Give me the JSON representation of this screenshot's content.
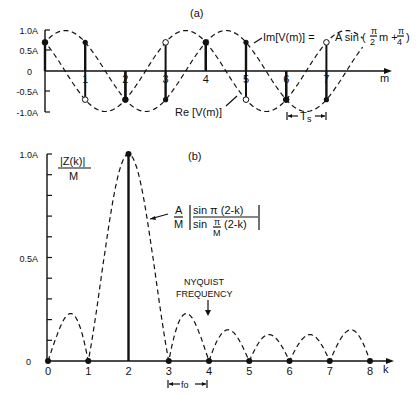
{
  "panel_a": {
    "label": "(a)",
    "y_ticks": [
      "1.0A",
      "0.5A",
      "0",
      "-0.5A",
      "-1.0A"
    ],
    "x_ticks": [
      "1",
      "2",
      "3",
      "4",
      "5",
      "6",
      "7"
    ],
    "x_axis_label": "m",
    "im_label_lhs": "Im[V(m)] = ",
    "im_label_rhs_prefix": "A sin (",
    "im_label_pi": "π",
    "im_label_den2": "2",
    "im_label_m": "m +",
    "im_label_den4": "4",
    "im_label_close": ")",
    "re_label": "Re [V(m)]",
    "period_label": "T",
    "period_sub": "s"
  },
  "panel_b": {
    "label": "(b)",
    "y_ticks": [
      "1.0A",
      "0.5A",
      "0"
    ],
    "y_axis_title_num": "|Z(k)|",
    "y_axis_title_den": "M",
    "x_ticks": [
      "0",
      "1",
      "2",
      "3",
      "4",
      "5",
      "6",
      "7",
      "8"
    ],
    "x_axis_label": "k",
    "formula_A": "A",
    "formula_M": "M",
    "formula_num": "sin π (2-k)",
    "formula_den": "sin",
    "formula_den_pi": "π",
    "formula_den_M": "M",
    "formula_den_tail": "(2-k)",
    "nyquist_line1": "NYQUIST",
    "nyquist_line2": "FREQUENCY",
    "fo_label": "fo"
  },
  "chart_data": [
    {
      "type": "scatter",
      "title": "(a)",
      "xlabel": "m",
      "ylabel": "",
      "ylim": [
        -1.0,
        1.0
      ],
      "x": [
        0,
        1,
        2,
        3,
        4,
        5,
        6,
        7
      ],
      "series": [
        {
          "name": "Im[V(m)] = A sin(π/2 m + π/4)",
          "marker": "filled",
          "values": [
            0.707,
            0.707,
            -0.707,
            -0.707,
            0.707,
            0.707,
            -0.707,
            -0.707
          ]
        },
        {
          "name": "Re[V(m)] = A cos(π/2 m + π/4)",
          "marker": "open",
          "values": [
            0.707,
            -0.707,
            -0.707,
            0.707,
            0.707,
            -0.707,
            -0.707,
            0.707
          ]
        }
      ],
      "annotations": [
        "Im[V(m)] = A sin(π/2 m + π/4)",
        "Re[V(m)]",
        "Ts (sample period between m=6 and m=7)"
      ],
      "grid": false
    },
    {
      "type": "line",
      "title": "(b)",
      "xlabel": "k",
      "ylabel": "|Z(k)|/M",
      "ylim": [
        0,
        1.0
      ],
      "M": 8,
      "x": [
        0,
        1,
        2,
        3,
        4,
        5,
        6,
        7,
        8
      ],
      "series": [
        {
          "name": "|Z(k)|/M (samples)",
          "values": [
            0,
            0,
            1.0,
            0,
            0,
            0,
            0,
            0,
            0
          ]
        },
        {
          "name": "A/M |sin π(2-k) / sin (π/M)(2-k)| (envelope)",
          "sidelobe_peaks": {
            "0.5": 0.225,
            "3.5": 0.225,
            "4.5": 0.15,
            "5.5": 0.127,
            "6.5": 0.127,
            "7.5": 0.15
          }
        }
      ],
      "annotations": [
        "NYQUIST FREQUENCY (k=4)",
        "fo (spacing between bins 3 and 4)"
      ],
      "grid": false
    }
  ]
}
